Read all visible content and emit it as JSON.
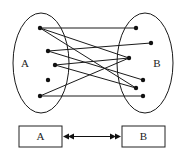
{
  "diagram": {
    "type": "bipartite-mapping",
    "colors": {
      "stroke": "#1a1a1a",
      "background": "#ffffff"
    },
    "set_a": {
      "label": "A",
      "ellipse": {
        "cx": 41,
        "cy": 63,
        "rx": 28,
        "ry": 50
      },
      "label_pos": {
        "x": 25,
        "y": 64
      },
      "points": [
        {
          "id": "a1",
          "x": 40,
          "y": 28
        },
        {
          "id": "a2",
          "x": 48,
          "y": 51
        },
        {
          "id": "a3",
          "x": 55,
          "y": 65
        },
        {
          "id": "a4",
          "x": 48,
          "y": 80
        },
        {
          "id": "a5",
          "x": 40,
          "y": 96
        }
      ]
    },
    "set_b": {
      "label": "B",
      "ellipse": {
        "cx": 145,
        "cy": 63,
        "rx": 28,
        "ry": 50
      },
      "label_pos": {
        "x": 157,
        "y": 64
      },
      "points": [
        {
          "id": "b1",
          "x": 136,
          "y": 28
        },
        {
          "id": "b2",
          "x": 151,
          "y": 43
        },
        {
          "id": "b3",
          "x": 129,
          "y": 58
        },
        {
          "id": "b4",
          "x": 143,
          "y": 80
        },
        {
          "id": "b5",
          "x": 136,
          "y": 88
        },
        {
          "id": "b6",
          "x": 143,
          "y": 96
        }
      ]
    },
    "edges": [
      [
        "a1",
        "b1"
      ],
      [
        "a1",
        "b3"
      ],
      [
        "a1",
        "b5"
      ],
      [
        "a2",
        "b2"
      ],
      [
        "a2",
        "b4"
      ],
      [
        "a3",
        "b3"
      ],
      [
        "a3",
        "b5"
      ],
      [
        "a5",
        "b3"
      ],
      [
        "a5",
        "b6"
      ]
    ],
    "bottom": {
      "box_a": {
        "label": "A",
        "x": 19,
        "y": 126,
        "w": 43,
        "h": 21
      },
      "box_b": {
        "label": "B",
        "x": 122,
        "y": 126,
        "w": 43,
        "h": 21
      },
      "arrow": {
        "kind": "bidirectional-double-head",
        "x1": 62,
        "x2": 122,
        "y": 136.5
      }
    }
  }
}
